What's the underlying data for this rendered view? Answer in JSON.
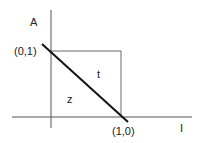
{
  "diagram": {
    "axes": {
      "y_label": "A",
      "x_label": "I"
    },
    "points": {
      "top": "(0,1)",
      "right": "(1,0)"
    },
    "regions": {
      "upper": "t",
      "lower": "z"
    },
    "colors": {
      "axis": "#555555",
      "square": "#666666",
      "line": "#111111"
    }
  }
}
